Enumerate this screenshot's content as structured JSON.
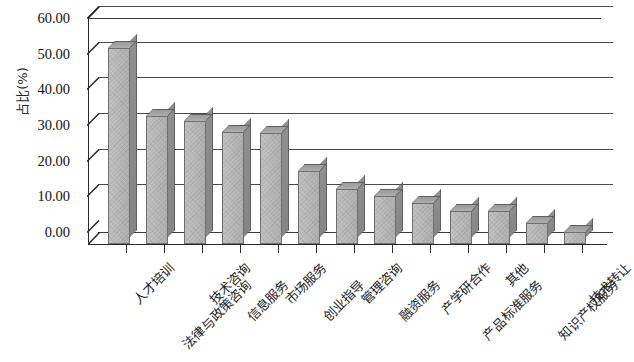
{
  "chart_data": {
    "type": "bar",
    "title": "",
    "subtitle": "",
    "xlabel": "",
    "ylabel": "占比(%)",
    "ylim": [
      0,
      60
    ],
    "ytick_labels": [
      "60.00",
      "50.00",
      "40.00",
      "30.00",
      "20.00",
      "10.00",
      "0.00"
    ],
    "ytick_values": [
      60,
      50,
      40,
      30,
      20,
      10,
      0
    ],
    "ytick_step": 10,
    "grid": true,
    "grid_axis": "y",
    "legend": null,
    "style": "3d-bar",
    "bar_color": "#b9b9b9",
    "bar_side_color": "#8c8c8c",
    "bar_edge_color": "#6f6f6f",
    "axis_color": "#2a2a2a",
    "categories": [
      "人才培训",
      "法律与政策咨询",
      "技术咨询",
      "信息服务",
      "市场服务",
      "创业指导",
      "管理咨询",
      "融资服务",
      "产学研合作",
      "产品标准服务",
      "其他",
      "知识产权服务",
      "技术转让"
    ],
    "values": [
      55.0,
      36.0,
      34.5,
      31.5,
      31.0,
      20.5,
      15.5,
      13.5,
      11.5,
      9.3,
      9.2,
      6.0,
      3.3
    ],
    "series": [
      {
        "name": "占比(%)",
        "values": [
          55.0,
          36.0,
          34.5,
          31.5,
          31.0,
          20.5,
          15.5,
          13.5,
          11.5,
          9.3,
          9.2,
          6.0,
          3.3
        ]
      }
    ]
  }
}
